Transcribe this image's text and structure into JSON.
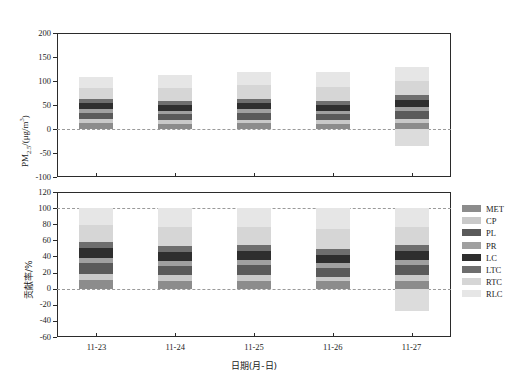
{
  "chart_data": [
    {
      "id": "pm25-panel",
      "type": "bar",
      "stacked": true,
      "title": "",
      "xlabel": "日期(月-日)",
      "ylabel": "PM2.5/(μg/m3)",
      "ylabel_plain": "PM",
      "ylabel_sub": "2.5",
      "ylabel_tail": "/(μg/m",
      "ylabel_sup": "3",
      "ylabel_end": ")",
      "categories": [
        "11-23",
        "11-24",
        "11-25",
        "11-26",
        "11-27"
      ],
      "ylim": [
        -100,
        200
      ],
      "yticks": [
        200,
        150,
        100,
        50,
        0,
        -50,
        -100
      ],
      "ytick_labels": [
        "200",
        "150",
        "100",
        "50",
        "0",
        "-50",
        "-100"
      ],
      "grid": false,
      "zero_reference_lines": [
        0
      ],
      "legend_position": "right-outside",
      "series": [
        {
          "name": "MET",
          "color": "#8c8c8c",
          "values": [
            12.0,
            11.0,
            11.5,
            10.5,
            12.5
          ]
        },
        {
          "name": "CP",
          "color": "#c9c9c9",
          "values": [
            8.0,
            7.5,
            8.0,
            7.5,
            9.0
          ]
        },
        {
          "name": "PL",
          "color": "#5a5a5a",
          "values": [
            14.0,
            13.5,
            14.5,
            13.0,
            16.0
          ]
        },
        {
          "name": "PR",
          "color": "#a0a0a0",
          "values": [
            7.0,
            6.5,
            7.0,
            6.5,
            8.0
          ]
        },
        {
          "name": "LC",
          "color": "#2e2e2e",
          "values": [
            13.0,
            12.5,
            13.5,
            12.5,
            15.0
          ]
        },
        {
          "name": "LTC",
          "color": "#6e6e6e",
          "values": [
            9.0,
            8.0,
            8.5,
            8.0,
            9.5
          ]
        },
        {
          "name": "RTC",
          "color": "#d6d6d6",
          "values": [
            23.0,
            27.0,
            28.0,
            30.0,
            30.0
          ]
        },
        {
          "name": "RLC",
          "color": "#e6e6e6",
          "values": [
            22.0,
            26.0,
            27.0,
            31.0,
            29.0
          ]
        }
      ],
      "negative_series": [
        {
          "name": "RLC-neg",
          "color": "#dcdcdc",
          "values": [
            0,
            0,
            0,
            0,
            -36.0
          ]
        }
      ],
      "bar_totals_positive": [
        108.0,
        112.0,
        118.0,
        119.0,
        129.0
      ]
    },
    {
      "id": "contribution-panel",
      "type": "bar",
      "stacked": true,
      "title": "",
      "xlabel": "日期(月-日)",
      "ylabel": "贡献率/%",
      "categories": [
        "11-23",
        "11-24",
        "11-25",
        "11-26",
        "11-27"
      ],
      "ylim": [
        -60,
        120
      ],
      "yticks": [
        120,
        100,
        80,
        60,
        40,
        20,
        0,
        -20,
        -40,
        -60
      ],
      "ytick_labels": [
        "120",
        "100",
        "80",
        "60",
        "40",
        "20",
        "0",
        "-20",
        "-40",
        "-60"
      ],
      "grid": false,
      "zero_reference_lines": [
        0,
        100
      ],
      "legend_position": "right-outside",
      "series": [
        {
          "name": "MET",
          "color": "#8c8c8c",
          "values": [
            11.0,
            10.0,
            10.0,
            9.0,
            9.5
          ]
        },
        {
          "name": "CP",
          "color": "#c9c9c9",
          "values": [
            7.5,
            6.5,
            7.0,
            6.0,
            7.0
          ]
        },
        {
          "name": "PL",
          "color": "#5a5a5a",
          "values": [
            13.0,
            12.0,
            12.5,
            11.0,
            12.5
          ]
        },
        {
          "name": "PR",
          "color": "#a0a0a0",
          "values": [
            6.5,
            6.0,
            6.0,
            5.5,
            6.0
          ]
        },
        {
          "name": "LC",
          "color": "#2e2e2e",
          "values": [
            12.0,
            11.0,
            11.5,
            10.5,
            11.5
          ]
        },
        {
          "name": "LTC",
          "color": "#6e6e6e",
          "values": [
            8.0,
            7.5,
            7.0,
            7.0,
            7.5
          ]
        },
        {
          "name": "RTC",
          "color": "#d6d6d6",
          "values": [
            21.0,
            23.5,
            23.0,
            25.0,
            23.0
          ]
        },
        {
          "name": "RLC",
          "color": "#e6e6e6",
          "values": [
            21.0,
            23.5,
            23.0,
            26.0,
            23.0
          ]
        }
      ],
      "negative_series": [
        {
          "name": "RLC-neg",
          "color": "#dcdcdc",
          "values": [
            0,
            0,
            0,
            0,
            -28.0
          ]
        }
      ],
      "bar_totals_positive": [
        100.0,
        100.0,
        100.0,
        100.0,
        100.0
      ]
    }
  ],
  "legend": {
    "items": [
      {
        "label": "MET",
        "color": "#8c8c8c"
      },
      {
        "label": "CP",
        "color": "#c9c9c9"
      },
      {
        "label": "PL",
        "color": "#5a5a5a"
      },
      {
        "label": "PR",
        "color": "#a0a0a0"
      },
      {
        "label": "LC",
        "color": "#2e2e2e"
      },
      {
        "label": "LTC",
        "color": "#6e6e6e"
      },
      {
        "label": "RTC",
        "color": "#d6d6d6"
      },
      {
        "label": "RLC",
        "color": "#e6e6e6"
      }
    ]
  },
  "axis": {
    "x_title": "日期(月-日)",
    "x_tick_labels": [
      "11-23",
      "11-24",
      "11-25",
      "11-26",
      "11-27"
    ]
  }
}
